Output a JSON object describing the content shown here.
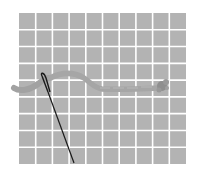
{
  "illustration": {
    "subject": "needle threading yarn through grid canvas",
    "grid": {
      "columns": 10,
      "rows": 9,
      "left": 19,
      "top": 13,
      "right": 186,
      "bottom": 164,
      "cell_color": "#b3b3b3",
      "line_color": "#ffffff",
      "line_width": 1.6
    },
    "yarn": {
      "color": "#9e9e9e",
      "knot_color": "#8f8f8f"
    },
    "needle": {
      "color": "#1a1a1a"
    }
  }
}
